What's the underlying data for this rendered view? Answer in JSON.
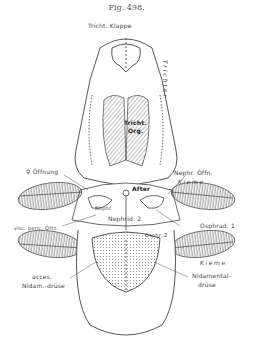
{
  "figure": {
    "title": "Fig. 498.",
    "labels": {
      "trichter_klappe": "Tricht. Klappe",
      "trichter": "Trichter",
      "trichter_organ_line1": "Tricht.",
      "trichter_organ_line2": "Org.",
      "female_opening": "♀ Öffnung",
      "nephr_opening": "Nephr. Öffn.",
      "kieme_upper": "Kieme",
      "after": "After",
      "nephr": "Nephr.",
      "nephrid_2": "Nephrid. 2",
      "visc_peric_opening": "visc. peric. Öffn.",
      "osphrad_1": "Osphrad. 1",
      "osphr_2": "Osphr. 2",
      "kieme_lower": "Kieme",
      "acces_line1": "acces.",
      "acces_line2": "Nidam.-drüse",
      "nidamental_line1": "Nidamental-",
      "nidamental_line2": "drüse"
    }
  }
}
